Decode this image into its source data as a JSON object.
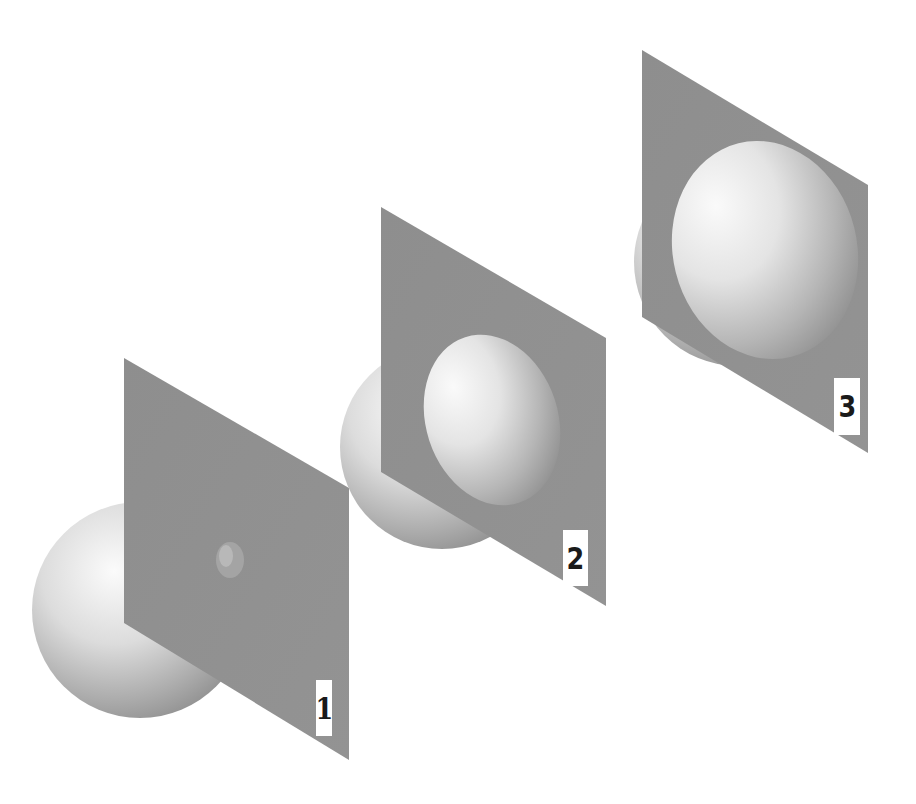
{
  "figure": {
    "background_color": "#ffffff",
    "plane_color": "#909090",
    "sphere_light_color": "#f4f4f4",
    "sphere_dark_color": "#8a8a8a",
    "stages": [
      {
        "id": 1,
        "label": "1"
      },
      {
        "id": 2,
        "label": "2"
      },
      {
        "id": 3,
        "label": "3"
      }
    ]
  }
}
